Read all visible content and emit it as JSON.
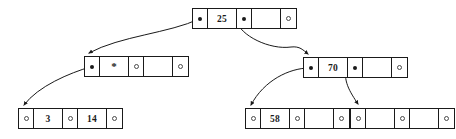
{
  "diagram": {
    "type": "tree",
    "canvas": {
      "width": 456,
      "height": 139
    },
    "style": {
      "line_color": "#1a1a1a",
      "background": "#ffffff",
      "filled_pointer_color": "#1a1a1a",
      "null_pointer_color": "#4a4a4a"
    },
    "nodes": [
      {
        "id": "root",
        "name": "root-node",
        "x": 192,
        "y": 8,
        "cells": [
          {
            "type": "pointer",
            "state": "filled",
            "value": ""
          },
          {
            "type": "key",
            "value": "25"
          },
          {
            "type": "pointer",
            "state": "filled",
            "value": ""
          },
          {
            "type": "key",
            "value": ""
          },
          {
            "type": "pointer",
            "state": "null",
            "value": ""
          }
        ]
      },
      {
        "id": "left-internal",
        "name": "left-internal-node",
        "x": 84,
        "y": 56,
        "cells": [
          {
            "type": "pointer",
            "state": "filled",
            "value": ""
          },
          {
            "type": "key",
            "value": "*"
          },
          {
            "type": "pointer",
            "state": "null",
            "value": ""
          },
          {
            "type": "key",
            "value": ""
          },
          {
            "type": "pointer",
            "state": "null",
            "value": ""
          }
        ]
      },
      {
        "id": "right-internal",
        "name": "right-internal-node",
        "x": 303,
        "y": 57,
        "cells": [
          {
            "type": "pointer",
            "state": "filled",
            "value": ""
          },
          {
            "type": "key",
            "value": "70"
          },
          {
            "type": "pointer",
            "state": "filled",
            "value": ""
          },
          {
            "type": "key",
            "value": ""
          },
          {
            "type": "pointer",
            "state": "null",
            "value": ""
          }
        ]
      },
      {
        "id": "leaf-left",
        "name": "leaf-node-left",
        "x": 18,
        "y": 108,
        "cells": [
          {
            "type": "pointer",
            "state": "null",
            "value": ""
          },
          {
            "type": "key",
            "value": "3"
          },
          {
            "type": "pointer",
            "state": "null",
            "value": ""
          },
          {
            "type": "key",
            "value": "14"
          },
          {
            "type": "pointer",
            "state": "null",
            "value": ""
          }
        ]
      },
      {
        "id": "leaf-middle",
        "name": "leaf-node-middle",
        "x": 245,
        "y": 108,
        "cells": [
          {
            "type": "pointer",
            "state": "null",
            "value": ""
          },
          {
            "type": "key",
            "value": "58"
          },
          {
            "type": "pointer",
            "state": "null",
            "value": ""
          },
          {
            "type": "key",
            "value": ""
          },
          {
            "type": "pointer",
            "state": "null",
            "value": ""
          }
        ]
      },
      {
        "id": "leaf-right",
        "name": "leaf-node-right",
        "x": 350,
        "y": 108,
        "cells": [
          {
            "type": "pointer",
            "state": "null",
            "value": ""
          },
          {
            "type": "key",
            "value": ""
          },
          {
            "type": "pointer",
            "state": "null",
            "value": ""
          },
          {
            "type": "key",
            "value": ""
          },
          {
            "type": "pointer",
            "state": "null",
            "value": ""
          }
        ]
      }
    ],
    "edges": [
      {
        "id": "root-to-left",
        "name": "edge-root-to-left-internal",
        "from": "root",
        "to": "left-internal",
        "path": "M 199 19 C 170 33 120 36 89 53"
      },
      {
        "id": "root-to-right",
        "name": "edge-root-to-right-internal",
        "from": "root",
        "to": "right-internal",
        "path": "M 236 20 C 240 36 270 50 291 47 C 300 46 303 50 308 54"
      },
      {
        "id": "left-to-leafleft",
        "name": "edge-left-internal-to-leaf-left",
        "from": "left-internal",
        "to": "leaf-left",
        "path": "M 90 67 C 70 73 38 86 24 105"
      },
      {
        "id": "right-to-leafmiddle",
        "name": "edge-right-internal-to-leaf-middle",
        "from": "right-internal",
        "to": "leaf-middle",
        "path": "M 309 68 C 290 68 264 80 251 105"
      },
      {
        "id": "right-to-leafright",
        "name": "edge-right-internal-to-leaf-right",
        "from": "right-internal",
        "to": "leaf-right",
        "path": "M 347 66 C 342 80 350 92 358 104"
      }
    ]
  }
}
